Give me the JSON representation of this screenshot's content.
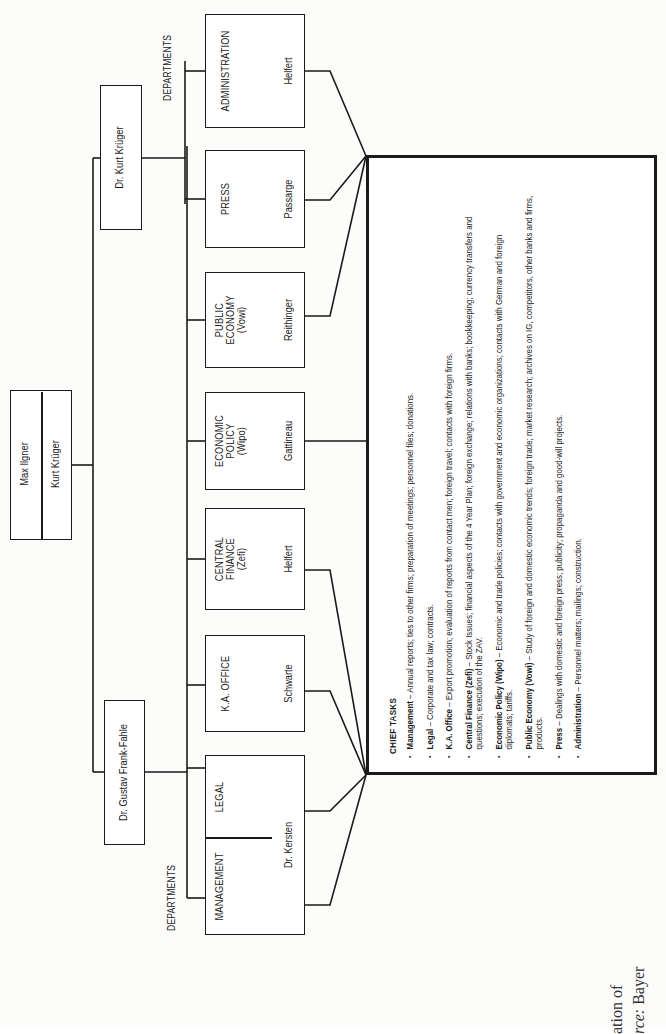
{
  "chart_title": "Organization chart: Ilgner / Krüger office with departments and chief tasks",
  "top": {
    "names": [
      "Max Ilgner",
      "Kurt Krüger"
    ]
  },
  "left_branch": {
    "head": "Dr. Gustav Frank-Fahle",
    "label": "DEPARTMENTS",
    "departments": [
      {
        "title": [
          "MANAGEMENT"
        ],
        "person": "Dr. Kersten"
      },
      {
        "title": [
          "LEGAL"
        ],
        "person": ""
      },
      {
        "title": [
          "K.A. OFFICE"
        ],
        "person": "Schwarte"
      },
      {
        "title": [
          "CENTRAL",
          "FINANCE",
          "(Zefi)"
        ],
        "person": "Helfert"
      },
      {
        "title": [
          "ECONOMIC",
          "POLICY",
          "(Wipo)"
        ],
        "person": "Gattineau"
      },
      {
        "title": [
          "PUBLIC",
          "ECONOMY",
          "(Vowi)"
        ],
        "person": "Reithinger"
      }
    ]
  },
  "right_branch": {
    "head": "Dr. Kurt Krüger",
    "label": "DEPARTMENTS",
    "departments": [
      {
        "title": [
          "PRESS"
        ],
        "person": "Passarge"
      },
      {
        "title": [
          "ADMINISTRATION"
        ],
        "person": "Helfert"
      }
    ]
  },
  "chief_tasks": {
    "header": "CHIEF TASKS",
    "items": [
      {
        "name": "Management",
        "text": " – Annual reports; ties to other firms; preparation of meetings; personnel files; donations."
      },
      {
        "name": "Legal",
        "text": " – Corporate and tax law; contracts."
      },
      {
        "name": "K.A. Office",
        "text": " – Export promotion; evaluation of reports from contact men; foreign travel; contacts with foreign firms."
      },
      {
        "name": "Central Finance (Zefi)",
        "text": " – Stock Issues; financial aspects of the 4 Year Plan; foreign exchange; relations with banks; bookkeeping; currency transfers and questions; execution of the ZAV."
      },
      {
        "name": "Economic Policy (Wipo)",
        "text": " – Economic and trade policies; contacts with government and economic organizations; contacts with German and foreign diplomats; tariffs."
      },
      {
        "name": "Public Economy (Vowi)",
        "text": " – Study of foreign and domestic economic trends; foreign trade; market research; archives on IG, competitors, other banks and firms, products."
      },
      {
        "name": "Press",
        "text": " – Dealings with domestic and foreign press; publicity; propaganda and good-will projects."
      },
      {
        "name": "Administration",
        "text": " – Personnel matters; mailings; construction."
      }
    ]
  },
  "caption": {
    "line1": "ation of",
    "line2_italic": "rce:",
    "line2_rest": " Bayer"
  }
}
